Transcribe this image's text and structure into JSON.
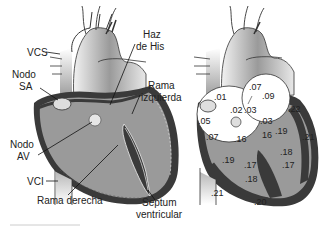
{
  "left_diagram": {
    "title": "Conduction system anatomy",
    "labels": {
      "vcs": "VCS",
      "nodo_sa_1": "Nodo",
      "nodo_sa_2": "SA",
      "haz_his_1": "Haz",
      "haz_his_2": "de His",
      "rama_izq_1": "Rama",
      "rama_izq_2": "izquierda",
      "nodo_av_1": "Nodo",
      "nodo_av_2": "AV",
      "vci": "VCI",
      "rama_derecha": "Rama derecha",
      "septum_1": "Septum",
      "septum_2": "ventricular"
    }
  },
  "right_diagram": {
    "title": "Activation times (s)",
    "values": {
      "v01": ".01",
      "v05": ".05",
      "v02": ".02",
      "v03a": ".03",
      "v07a": ".07",
      "v07b": ".07",
      "v09": ".09",
      "v03b": ".03",
      "v22": ".22",
      "v16a": ".16",
      "v16b": "16",
      "v19a": ".19",
      "v21a": ".21",
      "v19b": ".19",
      "v18a": ".18",
      "v17a": ".17",
      "v17b": ".17",
      "v18b": ".18",
      "v21b": ".21",
      "v20": ".20"
    }
  },
  "colors": {
    "wall": "#3a3a3a",
    "chamber": "#9a9a9a",
    "vessel_light": "#e6e6e6",
    "vessel_dark": "#8a8a8a",
    "node": "#d8d8d8",
    "white": "#ffffff"
  }
}
